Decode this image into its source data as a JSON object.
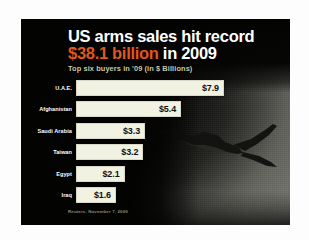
{
  "graphic": {
    "headline_line1": "US arms sales hit record",
    "headline_line2_amount": "$38.1 billion",
    "headline_line2_rest": " in 2009",
    "subtitle": "Top six buyers in '09 (in $ Billions)",
    "source": "Reuters, November 7, 2009",
    "accent_color": "#e2571e",
    "bar_color": "#f2f2e2",
    "background_color": "#0a0a08",
    "jet_icon": "fighter-jet-silhouette"
  },
  "chart_data": {
    "type": "bar",
    "title": "US arms sales hit record $38.1 billion in 2009",
    "subtitle": "Top six buyers in '09 (in $ Billions)",
    "orientation": "horizontal",
    "xlabel": "",
    "ylabel": "",
    "xlim": [
      0,
      7.9
    ],
    "grid": false,
    "legend": "none",
    "unit": "$ Billions",
    "categories": [
      "U.A.E.",
      "Afghanistan",
      "Saudi Arabia",
      "Taiwan",
      "Egypt",
      "Iraq"
    ],
    "values": [
      7.9,
      5.4,
      3.3,
      3.2,
      2.1,
      1.6
    ],
    "labels": [
      "$7.9",
      "$5.4",
      "$3.3",
      "$3.2",
      "$2.1",
      "$1.6"
    ],
    "total": 38.1,
    "source": "Reuters, November 7, 2009"
  }
}
